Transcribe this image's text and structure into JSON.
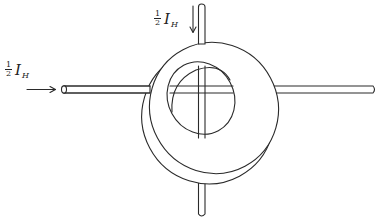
{
  "figure": {
    "labels": {
      "horizontal_current": {
        "coefficient_numerator": "1",
        "coefficient_denominator": "2",
        "symbol": "I",
        "subscript": "H"
      },
      "vertical_current": {
        "coefficient_numerator": "1",
        "coefficient_denominator": "2",
        "symbol": "I",
        "subscript": "H"
      }
    },
    "arrows": {
      "horizontal": {
        "direction": "right"
      },
      "vertical": {
        "direction": "down"
      }
    },
    "colors": {
      "line": "#2a2a2a",
      "background": "#ffffff"
    }
  }
}
